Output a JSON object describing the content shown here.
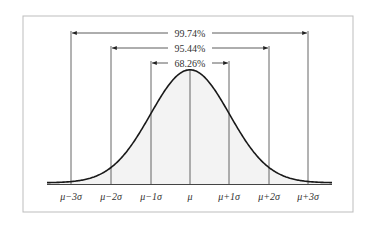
{
  "figure": {
    "colors": {
      "frame": "#bdbdbd",
      "curve": "#1a1a1a",
      "fill": "#f2f2f2",
      "lines": "#555555",
      "text": "#333333"
    }
  },
  "chart_data": {
    "type": "area",
    "title": "",
    "xlabel": "",
    "ylabel": "",
    "distribution": "normal",
    "x_tick_labels": [
      "μ−3σ",
      "μ−2σ",
      "μ−1σ",
      "μ",
      "μ+1σ",
      "μ+2σ",
      "μ+3σ"
    ],
    "x_tick_values": [
      -3,
      -2,
      -1,
      0,
      1,
      2,
      3
    ],
    "intervals": [
      {
        "label": "68.26%",
        "from": -1,
        "to": 1,
        "percent": 68.26
      },
      {
        "label": "95.44%",
        "from": -2,
        "to": 2,
        "percent": 95.44
      },
      {
        "label": "99.74%",
        "from": -3,
        "to": 3,
        "percent": 99.74
      }
    ],
    "grid": false,
    "legend": "none"
  },
  "labels": {
    "ticks": [
      "μ−3σ",
      "μ−2σ",
      "μ−1σ",
      "μ",
      "μ+1σ",
      "μ+2σ",
      "μ+3σ"
    ],
    "interval_1sd": "68.26%",
    "interval_2sd": "95.44%",
    "interval_3sd": "99.74%"
  }
}
